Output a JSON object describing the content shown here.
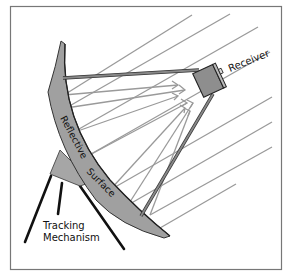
{
  "diagram": {
    "labels": {
      "receiver": "Receiver",
      "reflective": "Reflective",
      "surface": "Surface",
      "tracking_line1": "Tracking",
      "tracking_line2": "Mechanism"
    },
    "colors": {
      "frame": "#777777",
      "dish_fill": "#9e9e9e",
      "dish_stroke": "#333333",
      "ray": "#999999",
      "arm": "#808080",
      "receiver": "#8f8f8f",
      "leg": "#111111",
      "text": "#111111"
    },
    "components": [
      "Receiver",
      "Reflective Surface",
      "Tracking Mechanism",
      "Incoming sun rays",
      "Reflected rays"
    ]
  }
}
